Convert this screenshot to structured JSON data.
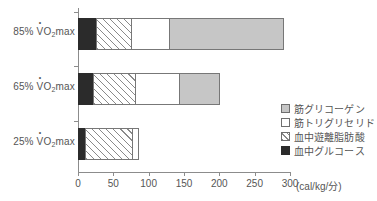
{
  "chart_data": {
    "type": "bar",
    "orientation": "horizontal",
    "stacked": true,
    "title": "",
    "xlabel": "(cal/kg/分)",
    "ylabel": "",
    "xlim": [
      0,
      300
    ],
    "xticks": [
      0,
      50,
      100,
      150,
      200,
      250,
      300
    ],
    "xtick_labels": [
      "0",
      "50",
      "100",
      "150",
      "200",
      "250",
      "300"
    ],
    "grid": false,
    "legend_position": "right",
    "categories": [
      "85% V̇O₂max",
      "65% V̇O₂max",
      "25% V̇O₂max"
    ],
    "series": [
      {
        "name": "血中グルコース",
        "key": "glucose",
        "color": "#2b2b2b",
        "pattern": "solid-dark",
        "values": [
          26,
          21,
          10
        ]
      },
      {
        "name": "血中遊離脂肪酸",
        "key": "ffa",
        "color": "#8a8a8a",
        "pattern": "diagonal-hatch",
        "values": [
          49,
          59,
          66
        ]
      },
      {
        "name": "筋トリグリセリド",
        "key": "trigly",
        "color": "#ffffff",
        "pattern": "empty",
        "values": [
          54,
          63,
          9
        ]
      },
      {
        "name": "筋グリコーゲン",
        "key": "glycogen",
        "color": "#c6c6c6",
        "pattern": "solid-gray",
        "values": [
          161,
          56,
          0
        ]
      }
    ],
    "totals": [
      290,
      199,
      85
    ]
  },
  "axis": {
    "unit_label": "(cal/kg/分)",
    "tick_0": "0",
    "tick_50": "50",
    "tick_100": "100",
    "tick_150": "150",
    "tick_200": "200",
    "tick_250": "250",
    "tick_300": "300"
  },
  "categories": [
    {
      "percent": "85",
      "pct_sign": "%",
      "v": "V",
      "o": "O",
      "sub": "2",
      "max": "max"
    },
    {
      "percent": "65",
      "pct_sign": "%",
      "v": "V",
      "o": "O",
      "sub": "2",
      "max": "max"
    },
    {
      "percent": "25",
      "pct_sign": "%",
      "v": "V",
      "o": "O",
      "sub": "2",
      "max": "max"
    }
  ],
  "legend": {
    "items": [
      {
        "label": "筋グリコーゲン",
        "swatch": "glycogen"
      },
      {
        "label": "筋トリグリセリド",
        "swatch": "trigly"
      },
      {
        "label": "血中遊離脂肪酸",
        "swatch": "ffa"
      },
      {
        "label": "血中グルコース",
        "swatch": "glucose"
      }
    ]
  },
  "colors": {
    "glycogen": "#c6c6c6",
    "triglyceride": "#ffffff",
    "ffa_hatch": "#8a8a8a",
    "glucose": "#2b2b2b",
    "axis": "#8c8c8c",
    "text": "#555555"
  }
}
